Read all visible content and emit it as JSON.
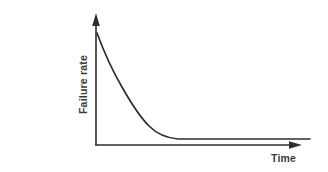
{
  "chart_data": {
    "type": "line",
    "title": "",
    "subtitle": "",
    "xlabel": "Time",
    "ylabel": "Failure rate",
    "legend": [],
    "annotations": [],
    "grid": false,
    "xticks": [],
    "yticks": [],
    "xlim": [
      0,
      1
    ],
    "ylim": [
      0,
      1
    ],
    "axis_arrows": {
      "x": "right",
      "y": "up"
    },
    "series": [
      {
        "name": "Failure rate",
        "shape": "exponential-decay",
        "x": [
          0.0,
          0.05,
          0.1,
          0.13,
          0.18,
          0.22,
          0.27,
          0.32,
          0.39,
          0.46,
          0.58,
          0.72,
          0.86,
          1.0
        ],
        "y": [
          1.0,
          0.87,
          0.73,
          0.64,
          0.5,
          0.39,
          0.27,
          0.18,
          0.1,
          0.06,
          0.05,
          0.05,
          0.05,
          0.05
        ],
        "asymptote": 0.05
      }
    ]
  },
  "geometry": {
    "y_axis_x": 96,
    "x_axis_y": 145,
    "y_axis_top": 13,
    "x_axis_right": 302,
    "curve_start": [
      97,
      33
    ],
    "curve_end": [
      310,
      139
    ],
    "curve_path": "M 97 33 C 104 52, 112 70, 122 87 C 131 103, 139 116, 149 126 C 157 134, 166 138, 178 139 L 310 139",
    "y_arrow_points": "96,13 92.2,26 99.8,26",
    "x_arrow_points": "302,145 289,141.2 289,148.8"
  },
  "colors": {
    "background": "#ffffff",
    "stroke": "#2e2e2e",
    "text": "#3a3a3a"
  }
}
